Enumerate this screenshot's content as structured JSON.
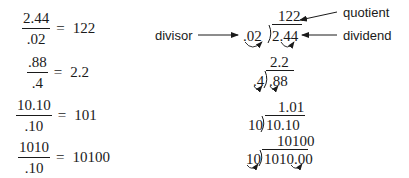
{
  "equations": [
    {
      "numerator": "2.44",
      "denominator": ".02",
      "equals": "=",
      "result": "122"
    },
    {
      "numerator": ".88",
      "denominator": ".4",
      "equals": "=",
      "result": "2.2"
    },
    {
      "numerator": "10.10",
      "denominator": ".10",
      "equals": "=",
      "result": "101"
    },
    {
      "numerator": "1010",
      "denominator": ".10",
      "equals": "=",
      "result": "10100"
    }
  ],
  "long_divisions": [
    {
      "quotient": "122.",
      "divisor": ".02",
      "dividend": "2.44"
    },
    {
      "quotient": "2.2",
      "divisor": ".4",
      "dividend": ".88"
    },
    {
      "quotient": "1.01",
      "divisor": "10",
      "dividend": "10.10"
    },
    {
      "quotient": "10100",
      "divisor": "10",
      "dividend": "1010.00"
    }
  ],
  "labels": {
    "divisor": "divisor",
    "quotient": "quotient",
    "dividend": "dividend"
  }
}
